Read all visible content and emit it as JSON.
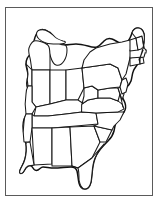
{
  "figure": {
    "title": "Outline map of the eastern United States",
    "type": "line-art-map",
    "frame_color": "#5a5a5a",
    "background_color": "#ffffff",
    "line_color": "#111111",
    "highlight_style": "vertical-hatch",
    "highlight_region_label": "Virginia"
  },
  "map": {
    "region_name": "Eastern United States",
    "projection_note": "simplified outline",
    "states": [
      {
        "id": "wi",
        "name": "Wisconsin"
      },
      {
        "id": "mi",
        "name": "Michigan"
      },
      {
        "id": "il",
        "name": "Illinois"
      },
      {
        "id": "in",
        "name": "Indiana"
      },
      {
        "id": "oh",
        "name": "Ohio"
      },
      {
        "id": "ia",
        "name": "Iowa"
      },
      {
        "id": "mo",
        "name": "Missouri"
      },
      {
        "id": "ky",
        "name": "Kentucky"
      },
      {
        "id": "tn",
        "name": "Tennessee"
      },
      {
        "id": "ar",
        "name": "Arkansas"
      },
      {
        "id": "la",
        "name": "Louisiana"
      },
      {
        "id": "ms",
        "name": "Mississippi"
      },
      {
        "id": "al",
        "name": "Alabama"
      },
      {
        "id": "ga",
        "name": "Georgia"
      },
      {
        "id": "fl",
        "name": "Florida"
      },
      {
        "id": "sc",
        "name": "South Carolina"
      },
      {
        "id": "nc",
        "name": "North Carolina"
      },
      {
        "id": "va",
        "name": "Virginia"
      },
      {
        "id": "wv",
        "name": "West Virginia"
      },
      {
        "id": "md",
        "name": "Maryland"
      },
      {
        "id": "de",
        "name": "Delaware"
      },
      {
        "id": "pa",
        "name": "Pennsylvania"
      },
      {
        "id": "nj",
        "name": "New Jersey"
      },
      {
        "id": "ny",
        "name": "New York"
      },
      {
        "id": "ct",
        "name": "Connecticut"
      },
      {
        "id": "ri",
        "name": "Rhode Island"
      },
      {
        "id": "ma",
        "name": "Massachusetts"
      },
      {
        "id": "vt",
        "name": "Vermont"
      },
      {
        "id": "nh",
        "name": "New Hampshire"
      },
      {
        "id": "me",
        "name": "Maine"
      }
    ]
  }
}
